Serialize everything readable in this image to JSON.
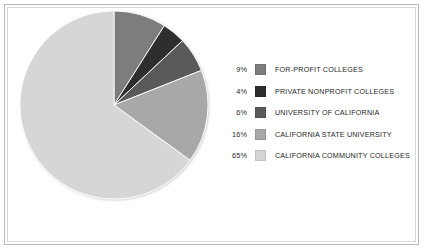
{
  "frame": {
    "border_color": "#b9b9b9",
    "inner_border_color": "#d8d8d8",
    "background": "#ffffff"
  },
  "chart_data": {
    "type": "pie",
    "title": "",
    "subtitle": "",
    "xlabel": "",
    "ylabel": "",
    "grid": false,
    "legend_position": "right",
    "start_angle_deg": 0,
    "direction": "clockwise",
    "categories": [
      "FOR-PROFIT COLLEGES",
      "PRIVATE NONPROFIT COLLEGES",
      "UNIVERSITY OF CALIFORNIA",
      "CALIFORNIA STATE UNIVERSITY",
      "CALIFORNIA COMMUNITY COLLEGES"
    ],
    "values": [
      9,
      4,
      6,
      16,
      65
    ],
    "value_labels": [
      "9%",
      "4%",
      "6%",
      "16%",
      "65%"
    ],
    "units": "percent",
    "colors": [
      "#7d7d7d",
      "#2e2e2e",
      "#5a5a5a",
      "#a8a8a8",
      "#d6d6d6"
    ],
    "slices": [
      {
        "label": "FOR-PROFIT COLLEGES",
        "value": 9,
        "value_label": "9%",
        "color": "#7d7d7d"
      },
      {
        "label": "PRIVATE NONPROFIT COLLEGES",
        "value": 4,
        "value_label": "4%",
        "color": "#2e2e2e"
      },
      {
        "label": "UNIVERSITY OF CALIFORNIA",
        "value": 6,
        "value_label": "6%",
        "color": "#5a5a5a"
      },
      {
        "label": "CALIFORNIA STATE UNIVERSITY",
        "value": 16,
        "value_label": "16%",
        "color": "#a8a8a8"
      },
      {
        "label": "CALIFORNIA COMMUNITY COLLEGES",
        "value": 65,
        "value_label": "65%",
        "color": "#d6d6d6"
      }
    ]
  },
  "legend": {
    "rows": [
      {
        "pct": "9%",
        "label": "FOR-PROFIT COLLEGES",
        "color": "#7d7d7d"
      },
      {
        "pct": "4%",
        "label": "PRIVATE NONPROFIT COLLEGES",
        "color": "#2e2e2e"
      },
      {
        "pct": "6%",
        "label": "UNIVERSITY OF CALIFORNIA",
        "color": "#5a5a5a"
      },
      {
        "pct": "16%",
        "label": "CALIFORNIA STATE UNIVERSITY",
        "color": "#a8a8a8"
      },
      {
        "pct": "65%",
        "label": "CALIFORNIA COMMUNITY COLLEGES",
        "color": "#d6d6d6"
      }
    ]
  }
}
